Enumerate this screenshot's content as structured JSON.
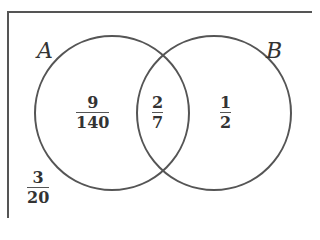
{
  "diagram": {
    "type": "venn",
    "frame_color": "#555555",
    "stroke_color": "#555555",
    "sets": [
      {
        "name": "A",
        "label": "A"
      },
      {
        "name": "B",
        "label": "B"
      }
    ],
    "regions": {
      "a_only": {
        "num": "9",
        "den": "140"
      },
      "a_and_b": {
        "num": "2",
        "den": "7"
      },
      "b_only": {
        "num": "1",
        "den": "2"
      },
      "outside": {
        "num": "3",
        "den": "20"
      }
    }
  }
}
